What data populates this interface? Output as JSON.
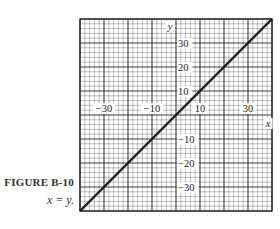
{
  "caption": {
    "label": "FIGURE B-10",
    "equation": "x = y."
  },
  "chart_data": {
    "type": "line",
    "title": "",
    "xlabel": "x",
    "ylabel": "y",
    "xlim": [
      -40,
      40
    ],
    "ylim": [
      -40,
      40
    ],
    "grid": true,
    "grid_minor_step": 2,
    "grid_major_step": 10,
    "x_tick_labels": [
      "-30",
      "-10",
      "10",
      "30"
    ],
    "y_tick_labels": [
      "30",
      "20",
      "10",
      "-10",
      "-20",
      "-30"
    ],
    "series": [
      {
        "name": "x = y",
        "x": [
          -40,
          40
        ],
        "y": [
          -40,
          40
        ]
      }
    ]
  },
  "colors": {
    "line": "#1a1a1a",
    "grid": "#333333",
    "background": "#ffffff"
  }
}
